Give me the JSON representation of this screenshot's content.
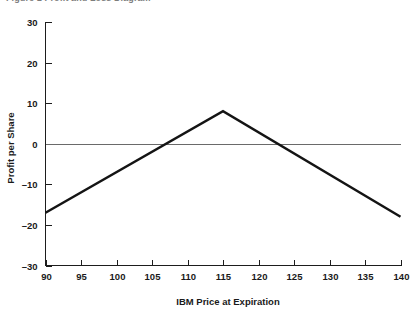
{
  "figure": {
    "caption_fragment": "Figure 1  Profit and Loss Diagram"
  },
  "chart_data": {
    "type": "line",
    "title": "",
    "xlabel": "IBM Price at Expiration",
    "ylabel": "Profit per Share",
    "xlim": [
      90,
      140
    ],
    "ylim": [
      -30,
      30
    ],
    "xticks": [
      90,
      95,
      100,
      105,
      110,
      115,
      120,
      125,
      130,
      135,
      140
    ],
    "xtick_labels": [
      "90",
      "95",
      "100",
      "105",
      "110",
      "115",
      "120",
      "125",
      "130",
      "135",
      "140"
    ],
    "yticks": [
      -30,
      -20,
      -10,
      0,
      10,
      20,
      30
    ],
    "ytick_labels": [
      "-30",
      "-20",
      "-10",
      "0",
      "10",
      "20",
      "30"
    ],
    "grid": false,
    "legend": null,
    "zero_reference_line": 0,
    "series": [
      {
        "name": "Profit per Share",
        "color": "#141414",
        "x": [
          90,
          115,
          140
        ],
        "values": [
          -17,
          8,
          -18
        ]
      }
    ],
    "annotations": {
      "peak_price": 115,
      "peak_profit": 8,
      "breakeven_lower": 107,
      "breakeven_upper": 123,
      "left_endpoint_profit": -17,
      "right_endpoint_profit": -18
    }
  }
}
